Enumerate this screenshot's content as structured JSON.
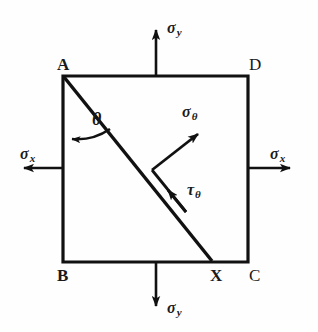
{
  "figure": {
    "kind": "stress-element-diagram",
    "background_color": "#fefefe",
    "ink_color": "#111111"
  },
  "square": {
    "label": "stress-element-square",
    "corners": [
      {
        "id": "A",
        "text": "A",
        "weight": "bold",
        "x": 57,
        "y": 56
      },
      {
        "id": "D",
        "text": "D",
        "weight": "normal",
        "x": 249,
        "y": 56
      },
      {
        "id": "B",
        "text": "B",
        "weight": "bold",
        "x": 57,
        "y": 267
      },
      {
        "id": "C",
        "text": "C",
        "weight": "normal",
        "x": 249,
        "y": 267
      }
    ],
    "geometry": {
      "left": 63,
      "top": 76,
      "right": 248,
      "bottom": 262
    }
  },
  "plane": {
    "label": "inclined-plane-AX",
    "from": "A",
    "to": "X",
    "point_x": {
      "id": "X",
      "text": "X",
      "weight": "bold",
      "x": 210,
      "y": 267
    }
  },
  "angle": {
    "label": "theta-angle-arc",
    "symbol": "θ",
    "x": 92,
    "y": 110
  },
  "stresses": [
    {
      "id": "sigma-y-top",
      "symbol": "σ",
      "subscript": "y",
      "direction": "up",
      "label_x": 167,
      "label_y": 20
    },
    {
      "id": "sigma-y-bottom",
      "symbol": "σ",
      "subscript": "y",
      "direction": "down",
      "label_x": 167,
      "label_y": 300
    },
    {
      "id": "sigma-x-left",
      "symbol": "σ",
      "subscript": "x",
      "direction": "left",
      "label_x": 20,
      "label_y": 146
    },
    {
      "id": "sigma-x-right",
      "symbol": "σ",
      "subscript": "x",
      "direction": "right",
      "label_x": 270,
      "label_y": 146
    },
    {
      "id": "sigma-theta",
      "symbol": "σ",
      "subscript": "θ",
      "direction": "normal-to-plane",
      "label_x": 182,
      "label_y": 104
    },
    {
      "id": "tau-theta",
      "symbol": "τ",
      "subscript": "θ",
      "direction": "along-plane",
      "label_x": 187,
      "label_y": 182
    }
  ]
}
